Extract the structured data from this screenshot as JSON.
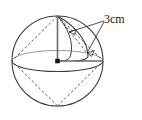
{
  "figure": {
    "name": "sphere-with-radius-annotation",
    "type": "geometry-diagram",
    "background_color": "#ffffff",
    "stroke_color": "#3c3c3c",
    "hidden_edge_color": "#555555",
    "accent_color": "#1a1a1a"
  },
  "labels": {
    "measure": "3cm"
  },
  "geometry": {
    "center": {
      "x": 57.5,
      "y": 61
    },
    "radius_x": 45.5,
    "radius_y": 45,
    "equator_rx": 45.5,
    "equator_ry": 10.5,
    "north_pole": {
      "x": 57.5,
      "y": 16
    },
    "south_pole": {
      "x": 57.5,
      "y": 106
    },
    "left_equator": {
      "x": 12,
      "y": 61
    },
    "right_equator": {
      "x": 103,
      "y": 61
    }
  },
  "annotations": {
    "leader_origin": {
      "x": 104,
      "y": 21
    },
    "arrow_upper_tip": {
      "x": 69,
      "y": 32
    },
    "arrow_lower_tip": {
      "x": 87,
      "y": 53
    }
  }
}
